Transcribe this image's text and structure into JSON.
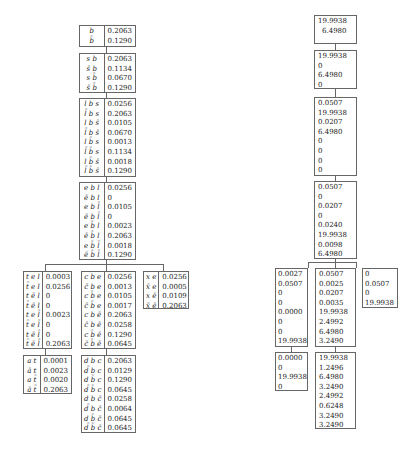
{
  "left_tree": {
    "nodes": [
      {
        "id": "L1",
        "rows": [
          [
            "b",
            "0.2063"
          ],
          [
            "b̄",
            "0.1290"
          ]
        ]
      },
      {
        "id": "L2",
        "rows": [
          [
            "s b",
            "0.2063"
          ],
          [
            "s̄ b",
            "0.1134"
          ],
          [
            "s b̄",
            "0.0670"
          ],
          [
            "s̄ b̄",
            "0.1290"
          ]
        ]
      },
      {
        "id": "L3",
        "rows": [
          [
            "l b s",
            "0.0256"
          ],
          [
            "l̄ b s",
            "0.2063"
          ],
          [
            "l b s̄",
            "0.0105"
          ],
          [
            "l̄ b s̄",
            "0.0670"
          ],
          [
            "l b̄ s",
            "0.0013"
          ],
          [
            "l̄ b̄ s",
            "0.1134"
          ],
          [
            "l b̄ s̄",
            "0.0018"
          ],
          [
            "l̄ b̄ s̄",
            "0.1290"
          ]
        ]
      },
      {
        "id": "L4",
        "rows": [
          [
            "e b l",
            "0.0256"
          ],
          [
            "ē b l",
            "0"
          ],
          [
            "e b l̄",
            "0.0105"
          ],
          [
            "ē b l̄",
            "0"
          ],
          [
            "e b̄ l",
            "0.0023"
          ],
          [
            "ē b̄ l",
            "0.2063"
          ],
          [
            "e b̄ l̄",
            "0.0018"
          ],
          [
            "ē b̄ l̄",
            "0.1290"
          ]
        ]
      },
      {
        "id": "L5",
        "rows": [
          [
            "t e l",
            "0.0003"
          ],
          [
            "t̄ e l",
            "0.0256"
          ],
          [
            "t ē l",
            "0"
          ],
          [
            "t̄ ē l",
            "0"
          ],
          [
            "t e l̄",
            "0.0023"
          ],
          [
            "t̄ e l̄",
            "0"
          ],
          [
            "t ē l̄",
            "0"
          ],
          [
            "t̄ ē l̄",
            "0.2063"
          ]
        ]
      },
      {
        "id": "L6",
        "rows": [
          [
            "c b e",
            "0.0256"
          ],
          [
            "c̄ b e",
            "0.0013"
          ],
          [
            "c b̄ e",
            "0.0105"
          ],
          [
            "c̄ b̄ e",
            "0.0017"
          ],
          [
            "c b ē",
            "0.2063"
          ],
          [
            "c̄ b ē",
            "0.0258"
          ],
          [
            "c b̄ ē",
            "0.1290"
          ],
          [
            "c̄ b̄ ē",
            "0.0645"
          ]
        ]
      },
      {
        "id": "L7",
        "rows": [
          [
            "x e",
            "0.0256"
          ],
          [
            "x̄ e",
            "0.0005"
          ],
          [
            "x ē",
            "0.0109"
          ],
          [
            "x̄ ē",
            "0.2063"
          ]
        ]
      },
      {
        "id": "L8",
        "rows": [
          [
            "a t",
            "0.0001"
          ],
          [
            "ā t",
            "0.0023"
          ],
          [
            "a t̄",
            "0.0020"
          ],
          [
            "ā t̄",
            "0.2063"
          ]
        ]
      },
      {
        "id": "L9",
        "rows": [
          [
            "d b c",
            "0.2063"
          ],
          [
            "d̄ b c",
            "0.0129"
          ],
          [
            "d b̄ c",
            "0.1290"
          ],
          [
            "d̄ b̄ c",
            "0.0645"
          ],
          [
            "d b c̄",
            "0.0258"
          ],
          [
            "d̄ b c̄",
            "0.0064"
          ],
          [
            "d b̄ c̄",
            "0.0645"
          ],
          [
            "d̄ b̄ c̄",
            "0.0645"
          ]
        ]
      }
    ]
  },
  "right_tree": {
    "nodes": [
      {
        "id": "R1",
        "values": [
          "19.9938",
          "6.4980"
        ]
      },
      {
        "id": "R2",
        "values": [
          "19.9938",
          "0",
          "6.4980",
          "0"
        ]
      },
      {
        "id": "R3",
        "values": [
          "0.0507",
          "19.9938",
          "0.0207",
          "6.4980",
          "0",
          "0",
          "0",
          "0"
        ]
      },
      {
        "id": "R4",
        "values": [
          "0.0507",
          "0",
          "0.0207",
          "0",
          "0.0240",
          "19.9938",
          "0.0098",
          "6.4980"
        ]
      },
      {
        "id": "R5",
        "values": [
          "0.0027",
          "0.0507",
          "0",
          "0",
          "0.0000",
          "0",
          "0",
          "19.9938"
        ]
      },
      {
        "id": "R6",
        "values": [
          "0.0507",
          "0.0025",
          "0.0207",
          "0.0035",
          "19.9938",
          "2.4992",
          "6.4980",
          "3.2490"
        ]
      },
      {
        "id": "R7",
        "values": [
          "0",
          "0.0507",
          "0",
          "19.9938"
        ]
      },
      {
        "id": "R8",
        "values": [
          "0.0000",
          "0",
          "19.9938",
          "0"
        ]
      },
      {
        "id": "R9",
        "values": [
          "19.9938",
          "1.2496",
          "6.4980",
          "3.2490",
          "2.4992",
          "0.6248",
          "3.2490",
          "3.2490"
        ]
      }
    ]
  }
}
